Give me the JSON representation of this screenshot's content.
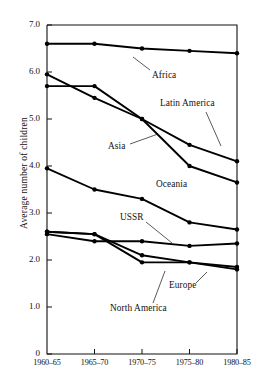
{
  "chart_data": {
    "type": "line",
    "title": "",
    "xlabel": "",
    "ylabel": "Average number of children",
    "categories": [
      "1960-65",
      "1965-70",
      "1970-75",
      "1975-80",
      "1980-85"
    ],
    "ylim": [
      0,
      7.0
    ],
    "yticks": [
      "0",
      "1.0",
      "2.0",
      "3.0",
      "4.0",
      "5.0",
      "6.0",
      "7.0"
    ],
    "ytick_values": [
      0,
      1.0,
      2.0,
      3.0,
      4.0,
      5.0,
      6.0,
      7.0
    ],
    "grid": false,
    "legend": "inline-annotations",
    "marker": "filled-circle",
    "line_color": "#000000",
    "series": [
      {
        "name": "Africa",
        "values": [
          6.6,
          6.6,
          6.5,
          6.45,
          6.4
        ]
      },
      {
        "name": "Latin America",
        "values": [
          5.7,
          5.7,
          5.0,
          4.45,
          4.1
        ]
      },
      {
        "name": "Asia",
        "values": [
          5.95,
          5.45,
          5.0,
          4.0,
          3.65
        ]
      },
      {
        "name": "Oceania",
        "values": [
          3.95,
          3.5,
          3.3,
          2.8,
          2.65
        ]
      },
      {
        "name": "USSR",
        "values": [
          2.55,
          2.4,
          2.4,
          2.3,
          2.35
        ]
      },
      {
        "name": "Europe",
        "values": [
          2.6,
          2.55,
          2.1,
          1.95,
          1.85
        ]
      },
      {
        "name": "North America",
        "values": [
          2.6,
          2.55,
          1.95,
          1.95,
          1.8
        ]
      }
    ],
    "annotations": [
      {
        "label": "Africa",
        "x": 152,
        "y": 76,
        "leader": [
          [
            150,
            70
          ],
          [
            133,
            57
          ]
        ]
      },
      {
        "label": "Latin America",
        "x": 160,
        "y": 104,
        "leader": [
          [
            206,
            112
          ],
          [
            221,
            146
          ]
        ]
      },
      {
        "label": "Asia",
        "x": 108,
        "y": 147,
        "leader": [
          [
            130,
            144
          ],
          [
            158,
            134
          ]
        ]
      },
      {
        "label": "Oceania",
        "x": 156,
        "y": 185,
        "leader": null
      },
      {
        "label": "USSR",
        "x": 120,
        "y": 218,
        "leader": [
          [
            146,
            222
          ],
          [
            172,
            243
          ]
        ]
      },
      {
        "label": "Europe",
        "x": 169,
        "y": 286,
        "leader": [
          [
            196,
            283
          ],
          [
            207,
            272
          ]
        ]
      },
      {
        "label": "North America",
        "x": 110,
        "y": 309,
        "leader": [
          [
            153,
            303
          ],
          [
            165,
            271
          ]
        ]
      }
    ]
  }
}
